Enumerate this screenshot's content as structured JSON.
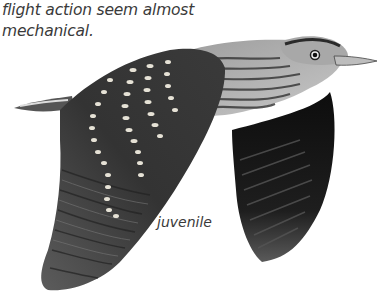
{
  "caption": {
    "lines": [
      "flight action seem almost",
      "mechanical."
    ]
  },
  "illustration": {
    "subject": "bird-in-flight",
    "label": "juvenile",
    "colors": {
      "wing_dark": "#2b2b2b",
      "wing_mid": "#4a4a4a",
      "body_streak": "#8a8a8a",
      "body_light": "#d4d4d4",
      "spots": "#e6e2d6",
      "far_wing": "#111111"
    }
  }
}
